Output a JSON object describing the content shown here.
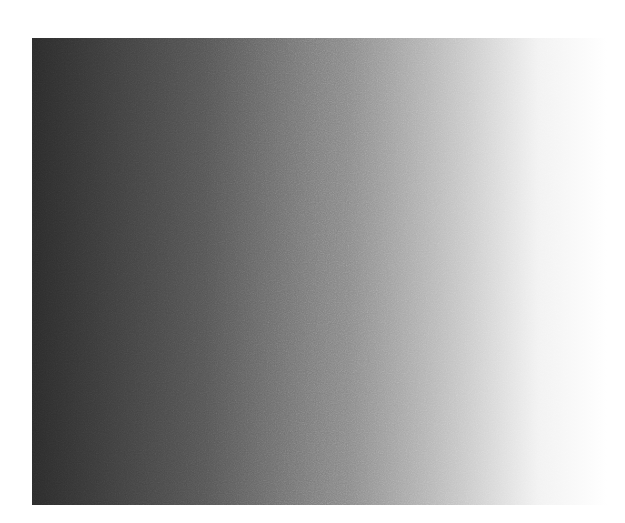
{
  "image": {
    "description": "Noisy horizontal grayscale gradient",
    "background_color": "#ffffff",
    "gradient": {
      "direction": "to right",
      "stops": [
        {
          "color": "#2b2b2b",
          "position": "0%"
        },
        {
          "color": "#555555",
          "position": "30%"
        },
        {
          "color": "#8a8a8a",
          "position": "55%"
        },
        {
          "color": "#c8c8c8",
          "position": "75%"
        },
        {
          "color": "#f2f2f2",
          "position": "88%"
        },
        {
          "color": "#ffffff",
          "position": "100%"
        }
      ]
    },
    "noise": {
      "type": "grain",
      "intensity": "medium"
    }
  }
}
